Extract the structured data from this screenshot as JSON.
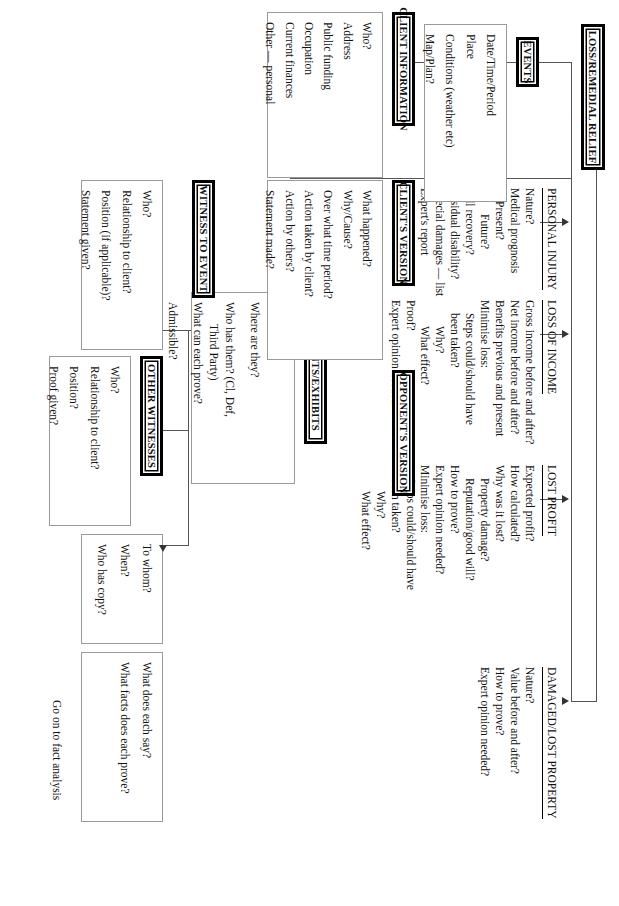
{
  "diagram": {
    "footer_note": "Go on to fact analysis",
    "headers": {
      "client_information": "CLIENT INFORMATION",
      "events": "EVENTS",
      "loss_remedial_relief": "LOSS/REMEDIAL RELIEF",
      "clients_version": "CLIENT'S VERSION",
      "opponents_version": "OPPONENT'S VERSION",
      "witness_to_event": "WITNESS TO EVENT",
      "other_witnesses": "OTHER WITNESSES",
      "documents_exhibits": "DOCUMENTS/EXHIBITS"
    },
    "panels": {
      "client_information": [
        "Who?",
        "Address",
        "Public funding",
        "Occupation",
        "Current finances",
        "Other — personal"
      ],
      "events": [
        "Date/Time/Period",
        "Place",
        "Conditions (weather etc)",
        "Map/Plan?"
      ],
      "clients_version": [
        "What happened?",
        "Why/Cause?",
        "Over what time period?",
        "Action taken by client?",
        "Action by others?",
        "Statement made?"
      ],
      "witness_to_event": [
        "Who?",
        "Relationship to client?",
        "Position (if applicable)?",
        "Statement given?"
      ],
      "other_witnesses": [
        "Who?",
        "Relationship to client?",
        "Position?",
        "Proof given?"
      ],
      "statement_detail": [
        "To whom?",
        "When?",
        "Who has copy?"
      ],
      "evidence_value": [
        "What does each say?",
        "What facts does each prove?"
      ],
      "documents_exhibits": [
        "List",
        "Where are they?",
        "Who has them? (Cl, Def,",
        "Third Party)",
        "What can each prove?",
        "Admissible?"
      ]
    },
    "relief": {
      "personal_injury": {
        "heading": "PERSONAL INJURY",
        "items": [
          {
            "text": "Nature?",
            "indent": 0
          },
          {
            "text": "Medical prognosis",
            "indent": 0
          },
          {
            "text": "Present?",
            "indent": 1
          },
          {
            "text": "Future?",
            "indent": 2
          },
          {
            "text": "Full recovery?",
            "indent": 0
          },
          {
            "text": "Residual disability?",
            "indent": 0
          },
          {
            "text": "Special damages — list",
            "indent": 0
          },
          {
            "text": "Expert's report",
            "indent": 0
          }
        ]
      },
      "loss_of_income": {
        "heading": "LOSS OF INCOME",
        "items": [
          {
            "text": "Gross income before and after?",
            "indent": 0
          },
          {
            "text": "Net income before and after?",
            "indent": 0
          },
          {
            "text": "Benefits previous and present",
            "indent": 0
          },
          {
            "text": "Minimise loss:",
            "indent": 0
          },
          {
            "text": "Steps could/should have",
            "indent": 1
          },
          {
            "text": "been taken?",
            "indent": 1
          },
          {
            "text": "Why?",
            "indent": 2
          },
          {
            "text": "What effect?",
            "indent": 2
          },
          {
            "text": "Proof?",
            "indent": 0
          },
          {
            "text": "Expert opinion needed?",
            "indent": 0
          }
        ]
      },
      "lost_profit": {
        "heading": "LOST PROFIT",
        "items": [
          {
            "text": "Expected profit?",
            "indent": 0
          },
          {
            "text": "How calculated?",
            "indent": 0
          },
          {
            "text": "Why was it lost?",
            "indent": 0
          },
          {
            "text": "Property damage?",
            "indent": 1
          },
          {
            "text": "Reputation/good will?",
            "indent": 1
          },
          {
            "text": "How to prove?",
            "indent": 0
          },
          {
            "text": "Expert opinion needed?",
            "indent": 0
          },
          {
            "text": "Minimise loss:",
            "indent": 0
          },
          {
            "text": "Steps could/should have",
            "indent": 1
          },
          {
            "text": "been taken?",
            "indent": 1
          },
          {
            "text": "Why?",
            "indent": 2
          },
          {
            "text": "What effect?",
            "indent": 2
          }
        ]
      },
      "damaged_lost_property": {
        "heading": "DAMAGED/LOST PROPERTY",
        "items": [
          {
            "text": "Nature?",
            "indent": 0
          },
          {
            "text": "Value before and after?",
            "indent": 0
          },
          {
            "text": "How to prove?",
            "indent": 0
          },
          {
            "text": "Expert opinion needed?",
            "indent": 0
          }
        ]
      }
    },
    "colors": {
      "ink": "#111111",
      "rule": "#9a9a9a",
      "connector": "#555555",
      "paper": "#ffffff"
    }
  }
}
